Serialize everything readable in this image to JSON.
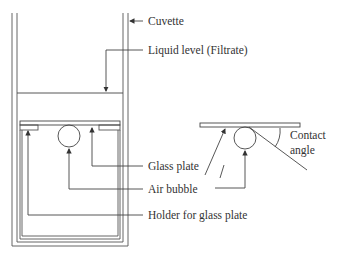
{
  "diagram": {
    "labels": {
      "cuvette": "Cuvette",
      "liquid_level": "Liquid level (Filtrate)",
      "glass_plate": "Glass plate",
      "air_bubble": "Air bubble",
      "holder": "Holder for glass plate",
      "contact_angle_line1": "Contact",
      "contact_angle_line2": "angle"
    },
    "colors": {
      "line": "#444444",
      "text": "#333333",
      "background": "#ffffff"
    }
  }
}
